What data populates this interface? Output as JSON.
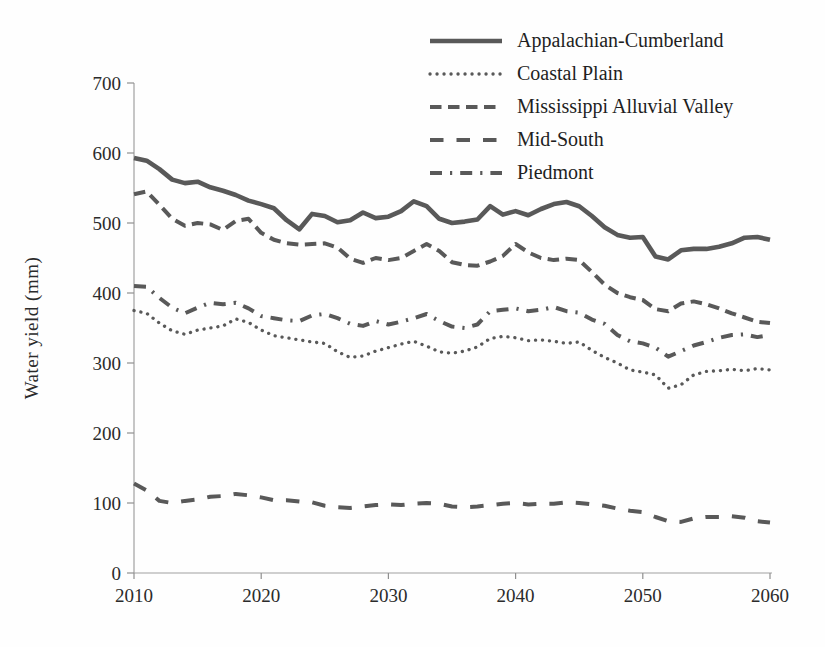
{
  "chart_data": {
    "type": "line",
    "title": "",
    "xlabel": "",
    "ylabel": "Water yield (mm)",
    "xlim": [
      2010,
      2060
    ],
    "ylim": [
      0,
      700
    ],
    "xticks": [
      2010,
      2020,
      2030,
      2040,
      2050,
      2060
    ],
    "yticks": [
      0,
      100,
      200,
      300,
      400,
      500,
      600,
      700
    ],
    "grid": false,
    "legend_position": "top-center-inside",
    "line_color": "#595959",
    "x": [
      2010,
      2011,
      2012,
      2013,
      2014,
      2015,
      2016,
      2017,
      2018,
      2019,
      2020,
      2021,
      2022,
      2023,
      2024,
      2025,
      2026,
      2027,
      2028,
      2029,
      2030,
      2031,
      2032,
      2033,
      2034,
      2035,
      2036,
      2037,
      2038,
      2039,
      2040,
      2041,
      2042,
      2043,
      2044,
      2045,
      2046,
      2047,
      2048,
      2049,
      2050,
      2051,
      2052,
      2053,
      2054,
      2055,
      2056,
      2057,
      2058,
      2059,
      2060
    ],
    "series": [
      {
        "name": "Appalachian-Cumberland",
        "dash": "solid",
        "values": [
          593,
          589,
          577,
          562,
          557,
          559,
          551,
          546,
          540,
          532,
          527,
          521,
          504,
          491,
          513,
          510,
          501,
          504,
          515,
          507,
          509,
          517,
          531,
          524,
          506,
          500,
          502,
          505,
          524,
          512,
          517,
          511,
          520,
          527,
          530,
          524,
          510,
          494,
          483,
          479,
          480,
          452,
          448,
          461,
          463,
          463,
          466,
          471,
          479,
          480,
          476
        ]
      },
      {
        "name": "Coastal Plain",
        "dash": "dotted",
        "values": [
          375,
          371,
          357,
          346,
          341,
          347,
          350,
          353,
          363,
          358,
          347,
          339,
          336,
          333,
          330,
          328,
          316,
          308,
          310,
          317,
          322,
          327,
          331,
          324,
          316,
          314,
          317,
          323,
          335,
          338,
          336,
          332,
          333,
          331,
          328,
          330,
          318,
          308,
          300,
          290,
          287,
          283,
          264,
          269,
          283,
          288,
          289,
          291,
          289,
          292,
          290
        ]
      },
      {
        "name": "Mississippi Alluvial Valley",
        "dash": "dash",
        "values": [
          541,
          545,
          526,
          506,
          496,
          500,
          498,
          490,
          503,
          506,
          486,
          476,
          471,
          469,
          470,
          471,
          465,
          449,
          443,
          450,
          447,
          450,
          460,
          470,
          460,
          444,
          440,
          439,
          445,
          453,
          470,
          458,
          450,
          447,
          449,
          447,
          430,
          412,
          400,
          394,
          390,
          377,
          374,
          385,
          388,
          384,
          378,
          371,
          365,
          359,
          357
        ]
      },
      {
        "name": "Mid-South",
        "dash": "long-dash",
        "values": [
          128,
          118,
          103,
          100,
          103,
          105,
          109,
          110,
          113,
          111,
          108,
          104,
          104,
          102,
          101,
          96,
          94,
          93,
          95,
          97,
          98,
          97,
          99,
          100,
          99,
          95,
          94,
          95,
          97,
          99,
          100,
          98,
          99,
          99,
          101,
          100,
          98,
          96,
          92,
          89,
          87,
          80,
          74,
          73,
          78,
          80,
          80,
          81,
          79,
          74,
          72
        ]
      },
      {
        "name": "Piedmont",
        "dash": "dash-dot",
        "values": [
          410,
          409,
          393,
          379,
          371,
          379,
          386,
          384,
          386,
          378,
          367,
          364,
          361,
          360,
          368,
          370,
          364,
          356,
          353,
          360,
          355,
          359,
          364,
          370,
          360,
          352,
          350,
          355,
          374,
          376,
          378,
          374,
          376,
          380,
          374,
          372,
          362,
          356,
          340,
          331,
          328,
          322,
          309,
          317,
          325,
          330,
          336,
          340,
          341,
          337,
          340
        ]
      }
    ]
  }
}
